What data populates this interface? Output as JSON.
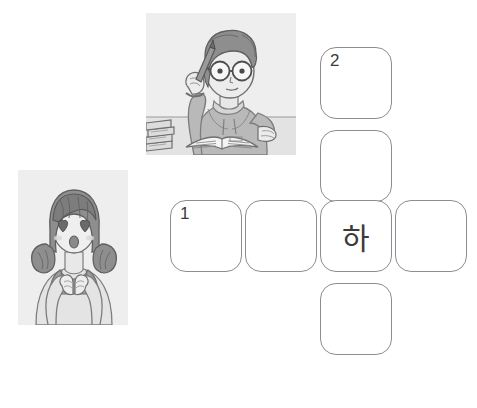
{
  "page": {
    "background_color": "#ffffff",
    "width": 477,
    "height": 408
  },
  "illustrations": [
    {
      "id": "studying-student",
      "description": "Grayscale line illustration of a student with curly hair and round glasses, holding a pencil to their head, wearing a hooded sweatshirt, sitting at a desk with an open textbook and a stack of books",
      "panel_color": "#eeeeee",
      "x": 146,
      "y": 13,
      "width": 150,
      "height": 142
    },
    {
      "id": "girl-heart-eyes",
      "description": "Grayscale line illustration of a girl with pigtails, heart-shaped eyes and an open mouth, hands clasped together at her chest",
      "panel_color": "#eeeeee",
      "x": 18,
      "y": 170,
      "width": 110,
      "height": 155
    }
  ],
  "crossword": {
    "cell_border_color": "#8c8c92",
    "cell_fill_color": "#ffffff",
    "text_color": "#3b3b3b",
    "cells": [
      {
        "id": "v1",
        "number": "2",
        "letter": "",
        "x": 320,
        "y": 47
      },
      {
        "id": "v2",
        "number": "",
        "letter": "",
        "x": 320,
        "y": 130
      },
      {
        "id": "center",
        "number": "",
        "letter": "하",
        "x": 320,
        "y": 200
      },
      {
        "id": "v4",
        "number": "",
        "letter": "",
        "x": 320,
        "y": 283
      },
      {
        "id": "h1",
        "number": "1",
        "letter": "",
        "x": 170,
        "y": 200
      },
      {
        "id": "h2",
        "number": "",
        "letter": "",
        "x": 245,
        "y": 200
      },
      {
        "id": "h4",
        "number": "",
        "letter": "",
        "x": 395,
        "y": 200
      }
    ],
    "clue_numbers": [
      "1",
      "2"
    ],
    "filled_letters": [
      "하"
    ]
  }
}
